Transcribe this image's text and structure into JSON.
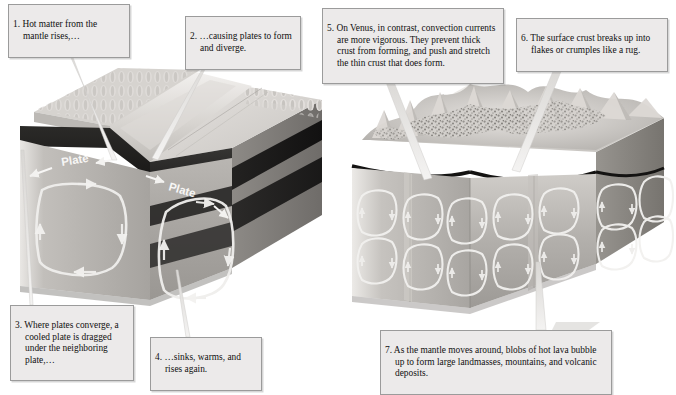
{
  "figure": {
    "background_color": "#ffffff",
    "callout_fill": "#eceaea",
    "callout_border": "#9b9b9b",
    "text_color": "#111111"
  },
  "callouts": [
    {
      "id": "1",
      "number": "1.",
      "text": "Hot matter from the mantle rises,…",
      "full": "1. Hot matter from the mantle rises,…",
      "points_to": "earth-ridge-crest"
    },
    {
      "id": "2",
      "number": "2.",
      "text": "…causing plates to form and diverge.",
      "full": "2. …causing plates to form and diverge.",
      "points_to": "earth-diverging-plate-surface"
    },
    {
      "id": "3",
      "number": "3.",
      "text": "Where plates converge, a cooled plate is dragged under the neighboring plate,…",
      "full": "3. Where plates converge, a cooled plate is dragged under the neighboring plate,…",
      "points_to": "earth-subduction-zone"
    },
    {
      "id": "4",
      "number": "4.",
      "text": "…sinks, warms, and rises again.",
      "full": "4. …sinks, warms, and rises again.",
      "points_to": "earth-convection-cell"
    },
    {
      "id": "5",
      "number": "5.",
      "text": "On Venus, in contrast, convection currents are more vigorous. They prevent thick crust from forming, and push and stretch the thin crust that does form.",
      "full": "5. On Venus, in contrast, convection currents are more vigorous. They prevent thick crust from forming, and push and stretch the thin crust that does form.",
      "points_to": "venus-thin-crust"
    },
    {
      "id": "6",
      "number": "6.",
      "text": "The surface crust breaks up into flakes or crumples like a rug.",
      "full": "6. The surface crust breaks up into flakes or crumples like a rug.",
      "points_to": "venus-crumpled-crust"
    },
    {
      "id": "7",
      "number": "7.",
      "text": "As the mantle moves around, blobs of hot lava bubble up to form large landmasses, mountains, and volcanic deposits.",
      "full": "7. As the mantle moves around, blobs of hot lava bubble up to form large landmasses, mountains, and volcanic deposits.",
      "points_to": "venus-mantle-blobs"
    }
  ],
  "diagram_labels": {
    "plate_left": "Plate",
    "plate_right": "Plate"
  },
  "blocks": {
    "earth": {
      "name": "earth-block",
      "description": "Cutaway 3D block of Earth showing mid-ocean ridge, diverging plates, subduction trench and two large mantle convection cells",
      "convection_cells": 2,
      "layers": [
        "crust",
        "upper-mantle-dark",
        "mantle-band",
        "lower-mantle"
      ]
    },
    "venus": {
      "name": "venus-block",
      "description": "Cutaway 3D block of Venus showing crumpled flaky crust and many small vigorous convection cells",
      "convection_cells": 16,
      "layers": [
        "thin-crust",
        "mantle"
      ]
    }
  }
}
